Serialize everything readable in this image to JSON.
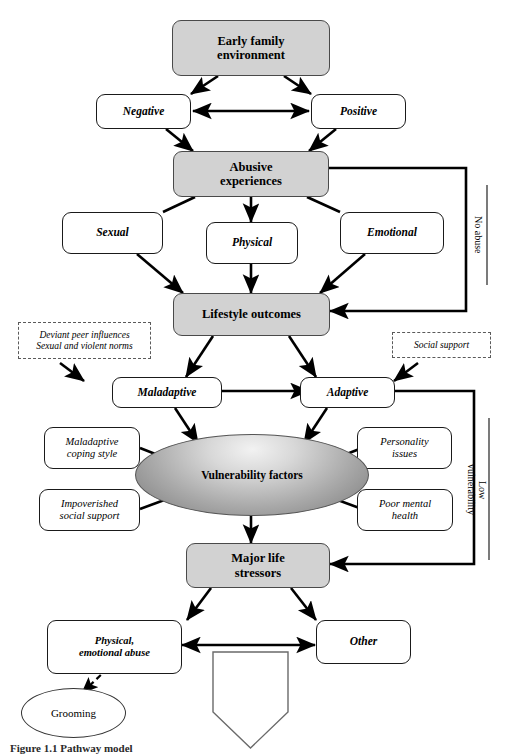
{
  "figure": {
    "caption": "Figure 1.1  Pathway model",
    "colors": {
      "shaded_fill": "#d2d2d2",
      "box_stroke": "#1a1a1a",
      "arrow": "#000000",
      "ellipse_mid": "#a9a9a9",
      "page_bg": "#ffffff"
    }
  },
  "nodes": {
    "early_family_environment": {
      "label": "Early family\nenvironment",
      "style": "shaded"
    },
    "negative": {
      "label": "Negative",
      "style": "outlined-italic"
    },
    "positive": {
      "label": "Positive",
      "style": "outlined-italic"
    },
    "abusive_experiences": {
      "label": "Abusive\nexperiences",
      "style": "shaded"
    },
    "sexual": {
      "label": "Sexual",
      "style": "outlined-italic"
    },
    "physical": {
      "label": "Physical",
      "style": "outlined-italic"
    },
    "emotional": {
      "label": "Emotional",
      "style": "outlined-italic"
    },
    "lifestyle_outcomes": {
      "label": "Lifestyle outcomes",
      "style": "shaded"
    },
    "deviant_peer_influences": {
      "label": "Deviant peer influences\nSexual and violent norms",
      "style": "dashed"
    },
    "social_support": {
      "label": "Social support",
      "style": "dashed"
    },
    "maladaptive": {
      "label": "Maladaptive",
      "style": "outlined-italic"
    },
    "adaptive": {
      "label": "Adaptive",
      "style": "outlined-italic"
    },
    "maladaptive_coping_style": {
      "label": "Maladaptive\ncoping style",
      "style": "outlined-italic-light"
    },
    "personality_issues": {
      "label": "Personality\nissues",
      "style": "outlined-italic-light"
    },
    "impoverished_social_support": {
      "label": "Impoverished\nsocial support",
      "style": "outlined-italic-light"
    },
    "poor_mental_health": {
      "label": "Poor mental\nhealth",
      "style": "outlined-italic-light"
    },
    "vulnerability_factors": {
      "label": "Vulnerability factors",
      "style": "ellipse-gradient"
    },
    "major_life_stressors": {
      "label": "Major life\nstressors",
      "style": "shaded"
    },
    "physical_emotional_abuse": {
      "label": "Physical,\nemotional abuse",
      "style": "outlined-italic"
    },
    "other": {
      "label": "Other",
      "style": "outlined-italic"
    },
    "grooming": {
      "label": "Grooming",
      "style": "ellipse-plain"
    },
    "continuation_arrow": {
      "label": "",
      "style": "pentagon-outline"
    }
  },
  "edge_labels": {
    "no_abuse": "No abuse",
    "low_vulnerability": "Low\nvulnerability"
  }
}
